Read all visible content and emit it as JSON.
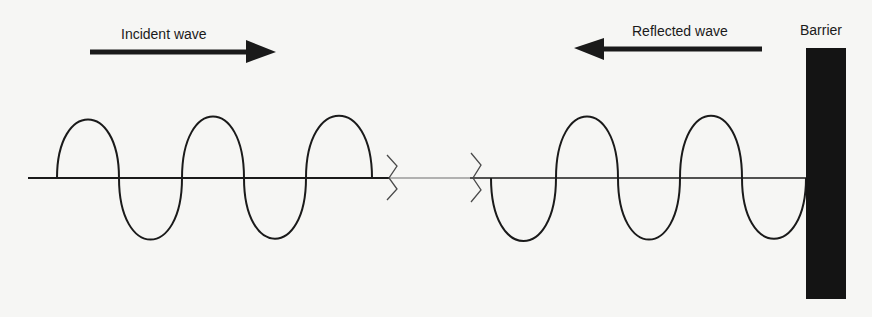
{
  "labels": {
    "incident_wave": "Incident wave",
    "reflected_wave": "Reflected wave",
    "barrier": "Barrier"
  },
  "colors": {
    "background": "#f6f6f4",
    "ink": "#1a1a1a",
    "barrier_fill": "#141414"
  },
  "elements": {
    "incident_arrow": {
      "direction": "right",
      "x1": 90,
      "x2": 276,
      "y": 52
    },
    "reflected_arrow": {
      "direction": "left",
      "x1": 762,
      "x2": 574,
      "y": 49
    },
    "barrier": {
      "x": 806,
      "y": 48,
      "width": 40,
      "height": 251
    },
    "baseline": {
      "y": 178,
      "x1": 28,
      "x2": 806
    },
    "break_marks": [
      {
        "x": 387
      },
      {
        "x": 471
      }
    ],
    "incident_wave": {
      "start_x": 57,
      "half_period": 62.5,
      "amplitude": 62,
      "half_cycles": 5
    },
    "reflected_wave": {
      "start_x": 490,
      "half_period": 63,
      "amplitude": 63,
      "half_cycles": 5
    }
  }
}
